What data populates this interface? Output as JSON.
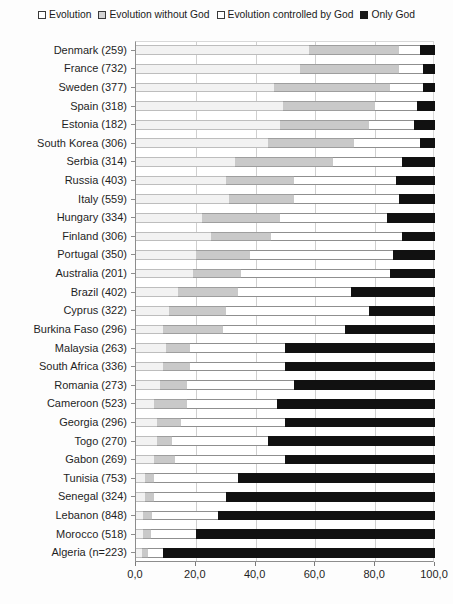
{
  "legend": {
    "position": "top",
    "items": [
      {
        "label": "Evolution",
        "icon": "square-outline-white-icon",
        "color": "#ffffff"
      },
      {
        "label": "Evolution without God",
        "icon": "square-outline-gray-icon",
        "color": "#d4d4d4"
      },
      {
        "label": "Evolution controlled by God",
        "icon": "square-outline-white-icon",
        "color": "#ffffff"
      },
      {
        "label": "Only God",
        "icon": "square-filled-black-icon",
        "color": "#1a1a1a"
      }
    ]
  },
  "axis": {
    "x_ticks": [
      "0,0",
      "20,0",
      "40,0",
      "60,0",
      "80,0",
      "100,0"
    ],
    "x_values": [
      0,
      20,
      40,
      60,
      80,
      100
    ],
    "xlim": [
      0,
      100
    ],
    "xlabel": "",
    "ylabel": ""
  },
  "chart_data": {
    "type": "bar",
    "orientation": "horizontal",
    "stacked": true,
    "normalized_percent": true,
    "title": "",
    "subtitle": "",
    "xlabel": "",
    "ylabel": "",
    "xlim": [
      0,
      100
    ],
    "grid": "vertical",
    "legend_position": "top",
    "categories": [
      "Denmark (259)",
      "France (732)",
      "Sweden (377)",
      "Spain (318)",
      "Estonia (182)",
      "South Korea (306)",
      "Serbia (314)",
      "Russia (403)",
      "Italy (559)",
      "Hungary (334)",
      "Finland (306)",
      "Portugal (350)",
      "Australia (201)",
      "Brazil (402)",
      "Cyprus (322)",
      "Burkina Faso (296)",
      "Malaysia (263)",
      "South Africa (336)",
      "Romania (273)",
      "Cameroon (523)",
      "Georgia (296)",
      "Togo (270)",
      "Gabon (269)",
      "Tunisia (753)",
      "Senegal (324)",
      "Lebanon (848)",
      "Morocco (518)",
      "Algeria (n=223)"
    ],
    "series": [
      {
        "name": "Evolution",
        "color": "#f2f2f2",
        "values": [
          58.0,
          55.0,
          46.0,
          49.0,
          48.0,
          44.0,
          33.0,
          30.0,
          31.0,
          22.0,
          25.0,
          20.0,
          19.0,
          14.0,
          11.0,
          9.0,
          10.0,
          9.0,
          8.0,
          6.0,
          7.0,
          7.0,
          6.0,
          3.0,
          3.0,
          2.5,
          2.5,
          2.0
        ]
      },
      {
        "name": "Evolution without God",
        "color": "#c9c9c9",
        "values": [
          30.0,
          33.0,
          39.0,
          31.0,
          30.0,
          29.0,
          33.0,
          23.0,
          22.0,
          26.0,
          20.0,
          18.0,
          16.0,
          20.0,
          19.0,
          20.0,
          8.0,
          9.0,
          9.0,
          11.0,
          8.0,
          5.0,
          7.0,
          3.0,
          3.0,
          3.0,
          2.5,
          2.0
        ]
      },
      {
        "name": "Evolution controlled by God",
        "color": "#ffffff",
        "values": [
          7.0,
          8.0,
          11.0,
          14.0,
          15.0,
          22.0,
          23.0,
          34.0,
          35.0,
          36.0,
          44.0,
          48.0,
          50.0,
          38.0,
          48.0,
          41.0,
          32.0,
          32.0,
          36.0,
          30.0,
          35.0,
          32.0,
          37.0,
          28.0,
          24.0,
          22.0,
          15.0,
          5.0
        ]
      },
      {
        "name": "Only God",
        "color": "#111111",
        "values": [
          5.0,
          4.0,
          4.0,
          6.0,
          7.0,
          5.0,
          11.0,
          13.0,
          12.0,
          16.0,
          11.0,
          14.0,
          15.0,
          28.0,
          22.0,
          30.0,
          50.0,
          50.0,
          47.0,
          53.0,
          50.0,
          56.0,
          50.0,
          66.0,
          70.0,
          72.5,
          80.0,
          91.0
        ]
      }
    ]
  }
}
